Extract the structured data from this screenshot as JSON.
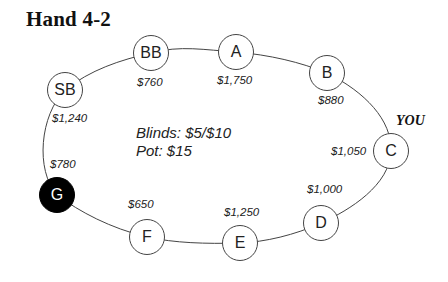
{
  "title": "Hand 4-2",
  "info": {
    "blinds": "Blinds: $5/$10",
    "pot": "Pot: $15"
  },
  "hero_label": "YOU",
  "colors": {
    "dealer_fill": "#000000",
    "seat_fill": "#ffffff",
    "line": "#444444"
  },
  "seats": [
    {
      "label": "BB",
      "stack": "$760"
    },
    {
      "label": "A",
      "stack": "$1,750"
    },
    {
      "label": "B",
      "stack": "$880"
    },
    {
      "label": "C",
      "stack": "$1,050"
    },
    {
      "label": "D",
      "stack": "$1,000"
    },
    {
      "label": "E",
      "stack": "$1,250"
    },
    {
      "label": "F",
      "stack": "$650"
    },
    {
      "label": "G",
      "stack": "$780"
    },
    {
      "label": "SB",
      "stack": "$1,240"
    }
  ]
}
